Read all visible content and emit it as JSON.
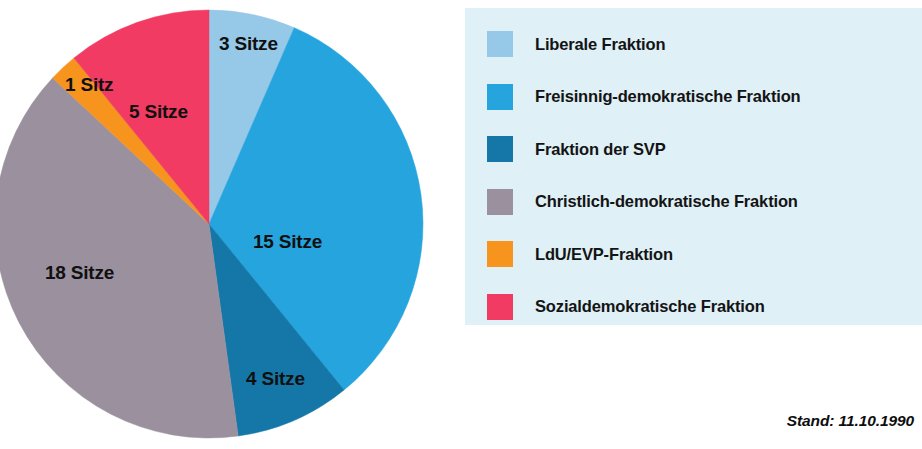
{
  "chart_data": {
    "type": "pie",
    "title": "",
    "unit_label_singular": "Sitz",
    "unit_label_plural": "Sitze",
    "total_seats": 46,
    "categories": [
      "Liberale Fraktion",
      "Freisinnig-demokratische Fraktion",
      "Fraktion der SVP",
      "Christlich-demokratische Fraktion",
      "LdU/EVP-Fraktion",
      "Sozialdemokratische Fraktion"
    ],
    "values": [
      3,
      15,
      4,
      18,
      1,
      5
    ],
    "colors": [
      "#96c8e8",
      "#25a4de",
      "#1577a8",
      "#9a909e",
      "#f7941e",
      "#f23b62"
    ],
    "start_angle_deg": 0,
    "direction": "clockwise",
    "legend_position": "right",
    "grid": false,
    "slices": [
      {
        "name": "Liberale Fraktion",
        "value": 3,
        "label": "3 Sitze",
        "color": "#96c8e8"
      },
      {
        "name": "Freisinnig-demokratische Fraktion",
        "value": 15,
        "label": "15 Sitze",
        "color": "#25a4de"
      },
      {
        "name": "Fraktion der SVP",
        "value": 4,
        "label": "4 Sitze",
        "color": "#1577a8"
      },
      {
        "name": "Christlich-demokratische Fraktion",
        "value": 18,
        "label": "18 Sitze",
        "color": "#9a909e"
      },
      {
        "name": "LdU/EVP-Fraktion",
        "value": 1,
        "label": "1 Sitz",
        "color": "#f7941e"
      },
      {
        "name": "Sozialdemokratische Fraktion",
        "value": 5,
        "label": "5 Sitze",
        "color": "#f23b62"
      }
    ]
  },
  "pie": {
    "labels": {
      "liberale": "3 Sitze",
      "fdp": "15 Sitze",
      "svp": "4 Sitze",
      "cvp": "18 Sitze",
      "ldu_evp": "1 Sitz",
      "sp": "5 Sitze"
    }
  },
  "legend": {
    "background": "#dff0f7",
    "items": [
      {
        "label": "Liberale Fraktion",
        "color": "#96c8e8"
      },
      {
        "label": "Freisinnig-demokratische Fraktion",
        "color": "#25a4de"
      },
      {
        "label": "Fraktion der SVP",
        "color": "#1577a8"
      },
      {
        "label": "Christlich-demokratische Fraktion",
        "color": "#9a909e"
      },
      {
        "label": "LdU/EVP-Fraktion",
        "color": "#f7941e"
      },
      {
        "label": "Sozialdemokratische Fraktion",
        "color": "#f23b62"
      }
    ]
  },
  "footer": {
    "stand": "Stand: 11.10.1990"
  }
}
